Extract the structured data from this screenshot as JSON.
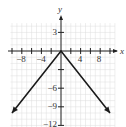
{
  "chart_data": {
    "type": "line",
    "title": "",
    "xlabel": "x",
    "ylabel": "y",
    "xlim": [
      -10,
      11
    ],
    "ylim": [
      -12.5,
      4.5
    ],
    "grid": true,
    "x_tick_labels": [
      "-8",
      "-4",
      "4",
      "8"
    ],
    "x_tick_values": [
      -8,
      -4,
      4,
      8
    ],
    "y_tick_labels": [
      "3",
      "-6",
      "-9",
      "-12"
    ],
    "y_tick_values": [
      3,
      -6,
      -9,
      -12
    ],
    "series": [
      {
        "name": "y = -|x|",
        "x": [
          -10,
          0,
          10
        ],
        "y": [
          -10,
          0,
          -10
        ],
        "arrows_at_ends": true
      }
    ]
  },
  "labels": {
    "x_axis": "x",
    "y_axis": "y",
    "xt": [
      "−8",
      "−4",
      "4",
      "8"
    ],
    "yt": [
      "3",
      "−6",
      "−9",
      "−12"
    ]
  },
  "colors": {
    "grid": "#dcdcdc",
    "axis": "#222222",
    "line": "#1a1a1a"
  }
}
